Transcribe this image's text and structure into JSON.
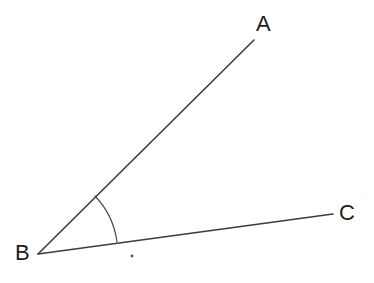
{
  "figure": {
    "type": "geometry-diagram",
    "background_color": "#ffffff",
    "width": 374,
    "height": 283
  },
  "labels": {
    "a": "A",
    "b": "B",
    "c": "C"
  },
  "colors": {
    "line": "#3c3c3c",
    "arc": "#4a4a4a",
    "label": "#1d1d1d",
    "dot": "#555555",
    "background": "#ffffff"
  },
  "geometry": {
    "vertex": {
      "name": "B",
      "x": 38,
      "y": 254
    },
    "rays": [
      {
        "name": "ray-ba",
        "from_x": 38,
        "from_y": 254,
        "to_x": 254,
        "to_y": 40,
        "endpoint_label": "A"
      },
      {
        "name": "ray-bc",
        "from_x": 38,
        "from_y": 254,
        "to_x": 333,
        "to_y": 214,
        "endpoint_label": "C"
      }
    ],
    "arc": {
      "name": "angle-arc",
      "center_x": 38,
      "center_y": 254,
      "radius": 82,
      "start_x": 95,
      "start_y": 196,
      "end_x": 117,
      "end_y": 242
    },
    "dot": {
      "name": "interior-dot",
      "x": 132,
      "y": 256,
      "radius": 1.4
    },
    "label_positions": {
      "a": {
        "x": 256,
        "y": 13
      },
      "b": {
        "x": 15,
        "y": 242
      },
      "c": {
        "x": 339,
        "y": 202
      }
    }
  }
}
